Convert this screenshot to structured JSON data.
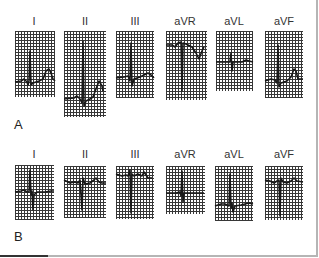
{
  "figure": {
    "type": "12-lead ECG limb leads comparison",
    "rows": [
      {
        "label": "A",
        "leads": [
          {
            "name": "I"
          },
          {
            "name": "II"
          },
          {
            "name": "III"
          },
          {
            "name": "aVR"
          },
          {
            "name": "aVL"
          },
          {
            "name": "aVF"
          }
        ]
      },
      {
        "label": "B",
        "leads": [
          {
            "name": "I"
          },
          {
            "name": "II"
          },
          {
            "name": "III"
          },
          {
            "name": "aVR"
          },
          {
            "name": "aVL"
          },
          {
            "name": "aVF"
          }
        ]
      }
    ]
  },
  "colors": {
    "grid": "#222222",
    "trace": "#000000",
    "label": "#333333",
    "border": "#b5b5b5"
  }
}
